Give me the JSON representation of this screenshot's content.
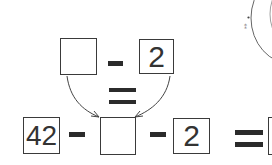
{
  "equation_top": {
    "left_box": "",
    "operator": "minus",
    "right_box": "2"
  },
  "middle_operator": "equals",
  "equation_bottom": {
    "box1": "42",
    "op1": "minus",
    "box2": "",
    "op2": "minus",
    "box3": "2",
    "op3": "equals",
    "box4": ""
  },
  "arrows": [
    {
      "from": "top-left-box",
      "to": "bottom-empty-box"
    },
    {
      "from": "top-right-box",
      "to": "bottom-empty-box"
    }
  ],
  "decoration": "partial-circle-illustration",
  "colors": {
    "stroke": "#3a3a3a",
    "bar": "#2b2b2b"
  }
}
